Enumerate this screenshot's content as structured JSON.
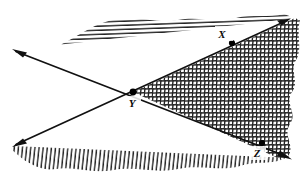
{
  "figure": {
    "type": "geometry-diagram",
    "canvas": {
      "width": 304,
      "height": 173,
      "background": "#ffffff"
    },
    "ink_color": "#111111",
    "hatch_color": "#2b2b2b",
    "points": [
      {
        "id": "X",
        "label": "X",
        "x": 232,
        "y": 43,
        "label_x": 222,
        "label_y": 36,
        "on_line": "line-1"
      },
      {
        "id": "Y",
        "label": "Y",
        "x": 133,
        "y": 92,
        "label_x": 131,
        "label_y": 106,
        "on_line": "intersection"
      },
      {
        "id": "Z",
        "label": "Z",
        "x": 262,
        "y": 143,
        "label_x": 256,
        "label_y": 157,
        "on_line": "line-2"
      }
    ],
    "lines": [
      {
        "id": "line-1",
        "name": "line-y-x-rising",
        "description": "Line rising to the right through Y, X and the upper-right arrowhead",
        "from": {
          "x": 13,
          "y": 146
        },
        "to": {
          "x": 290,
          "y": 19
        },
        "arrows": "both"
      },
      {
        "id": "line-2",
        "name": "line-y-z-falling",
        "description": "Line falling to the right through Y, Z and the lower-right arrowhead",
        "from": {
          "x": 13,
          "y": 50
        },
        "to": {
          "x": 291,
          "y": 158
        },
        "arrows": "both"
      }
    ],
    "regions": [
      {
        "id": "region-upper",
        "name": "upper-region",
        "hatch": "horizontal",
        "description": "Region above both lines, hatched with horizontal lines"
      },
      {
        "id": "region-lower",
        "name": "lower-region",
        "hatch": "vertical",
        "description": "Region below both lines, hatched with vertical lines"
      },
      {
        "id": "region-right",
        "name": "right-wedge-region",
        "hatch": "crosshatch",
        "description": "Wedge right of Y between the two lines, crosshatched (overlap of both shadings)"
      }
    ],
    "notes": {
      "shading_style": "hand-drawn pen hatching with irregular wavy outer boundaries",
      "point_marker": "filled black dot"
    }
  }
}
